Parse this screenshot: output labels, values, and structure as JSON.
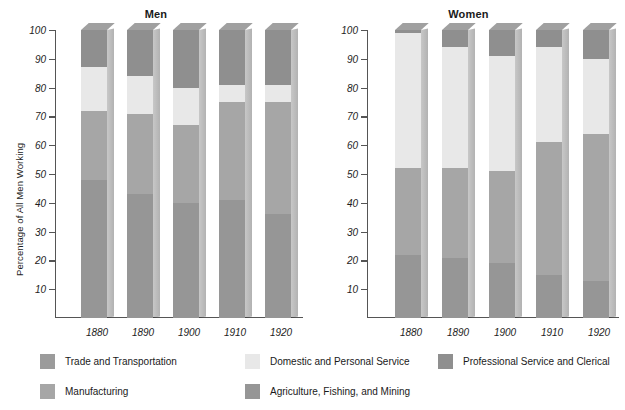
{
  "figure": {
    "panels": [
      {
        "title": "Men",
        "ylabel": "Percentage of All Men Working"
      },
      {
        "title": "Women",
        "ylabel": "Percentage of All Women Working"
      }
    ]
  },
  "legend": {
    "items": [
      {
        "label": "Trade and Transportation",
        "color": "#9b9b9b"
      },
      {
        "label": "Domestic and Personal Service",
        "color": "#e8e8e8"
      },
      {
        "label": "Professional Service and Clerical",
        "color": "#8f8f8f"
      },
      {
        "label": "Manufacturing",
        "color": "#a6a6a6"
      },
      {
        "label": "Agriculture, Fishing, and Mining",
        "color": "#969696"
      }
    ]
  },
  "chart_data": [
    {
      "type": "bar",
      "title": "Men",
      "xlabel": "",
      "ylabel": "Percentage of All Men Working",
      "ylim": [
        0,
        100
      ],
      "yticks": [
        10,
        20,
        30,
        40,
        50,
        60,
        70,
        80,
        90,
        100
      ],
      "grid": false,
      "stacked": true,
      "legend_position": "bottom",
      "categories": [
        "1880",
        "1890",
        "1900",
        "1910",
        "1920"
      ],
      "series": [
        {
          "name": "Agriculture, Fishing, and Mining",
          "color": "#969696",
          "values": [
            48,
            43,
            40,
            41,
            36
          ]
        },
        {
          "name": "Manufacturing",
          "color": "#a6a6a6",
          "values": [
            24,
            28,
            27,
            34,
            39
          ]
        },
        {
          "name": "Trade and Transportation",
          "color": "#9b9b9b",
          "values": [
            0,
            0,
            0,
            0,
            0
          ]
        },
        {
          "name": "Domestic and Personal Service",
          "color": "#e8e8e8",
          "values": [
            15,
            13,
            13,
            6,
            6
          ]
        },
        {
          "name": "Professional Service and Clerical",
          "color": "#8f8f8f",
          "values": [
            13,
            16,
            20,
            19,
            19
          ]
        }
      ],
      "cumulative_tops": [
        [
          48,
          72,
          72,
          87,
          100
        ],
        [
          43,
          71,
          71,
          84,
          100
        ],
        [
          40,
          67,
          67,
          80,
          100
        ],
        [
          41,
          75,
          75,
          81,
          100
        ],
        [
          36,
          75,
          75,
          81,
          100
        ]
      ]
    },
    {
      "type": "bar",
      "title": "Women",
      "xlabel": "",
      "ylabel": "Percentage of All Women Working",
      "ylim": [
        0,
        100
      ],
      "yticks": [
        10,
        20,
        30,
        40,
        50,
        60,
        70,
        80,
        90,
        100
      ],
      "grid": false,
      "stacked": true,
      "legend_position": "bottom",
      "categories": [
        "1880",
        "1890",
        "1900",
        "1910",
        "1920"
      ],
      "series": [
        {
          "name": "Agriculture, Fishing, and Mining",
          "color": "#969696",
          "values": [
            22,
            21,
            19,
            15,
            13
          ]
        },
        {
          "name": "Manufacturing",
          "color": "#a6a6a6",
          "values": [
            30,
            31,
            32,
            46,
            51
          ]
        },
        {
          "name": "Trade and Transportation",
          "color": "#9b9b9b",
          "values": [
            0,
            0,
            0,
            0,
            0
          ]
        },
        {
          "name": "Domestic and Personal Service",
          "color": "#e8e8e8",
          "values": [
            47,
            42,
            40,
            33,
            26
          ]
        },
        {
          "name": "Professional Service and Clerical",
          "color": "#8f8f8f",
          "values": [
            1,
            6,
            9,
            6,
            10
          ]
        }
      ],
      "cumulative_tops": [
        [
          22,
          52,
          52,
          99,
          100
        ],
        [
          21,
          52,
          52,
          94,
          100
        ],
        [
          19,
          51,
          51,
          91,
          100
        ],
        [
          15,
          61,
          61,
          94,
          100
        ],
        [
          13,
          64,
          64,
          90,
          100
        ]
      ]
    }
  ]
}
